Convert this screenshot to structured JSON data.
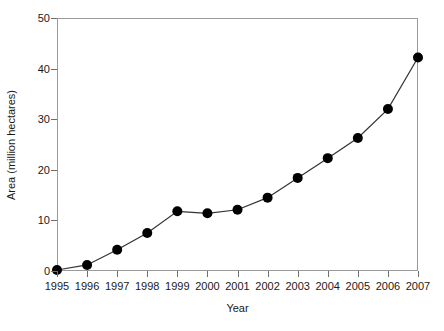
{
  "chart_data": {
    "type": "line",
    "title": "",
    "xlabel": "Year",
    "ylabel": "Area (million hectares)",
    "x": [
      1995,
      1996,
      1997,
      1998,
      1999,
      2000,
      2001,
      2002,
      2003,
      2004,
      2005,
      2006,
      2007
    ],
    "categories": [
      "1995",
      "1996",
      "1997",
      "1998",
      "1999",
      "2000",
      "2001",
      "2002",
      "2003",
      "2004",
      "2005",
      "2006",
      "2007"
    ],
    "values": [
      0.2,
      1.2,
      4.2,
      7.5,
      11.8,
      11.4,
      12.1,
      14.5,
      18.4,
      22.3,
      26.3,
      32.0,
      42.2
    ],
    "series": [
      {
        "name": "Area",
        "values": [
          0.2,
          1.2,
          4.2,
          7.5,
          11.8,
          11.4,
          12.1,
          14.5,
          18.4,
          22.3,
          26.3,
          32.0,
          42.2
        ]
      }
    ],
    "xlim": [
      1995,
      2007
    ],
    "ylim": [
      0,
      50
    ],
    "yticks": [
      0,
      10,
      20,
      30,
      40,
      50
    ],
    "ytick_labels": [
      "0",
      "10",
      "20",
      "30",
      "40",
      "50"
    ],
    "xticks": [
      1995,
      1996,
      1997,
      1998,
      1999,
      2000,
      2001,
      2002,
      2003,
      2004,
      2005,
      2006,
      2007
    ],
    "grid": false,
    "legend": null,
    "legend_position": "none",
    "marker": "filled-circle",
    "marker_color": "#000000",
    "line_color": "#333333",
    "frame_color": "#9a9a9a",
    "background": "#ffffff"
  }
}
